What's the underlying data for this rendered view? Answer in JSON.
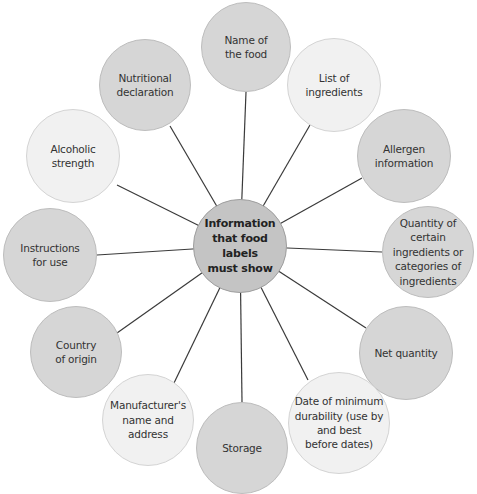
{
  "diagram": {
    "type": "radial-spider-diagram",
    "center": {
      "label": "Information\nthat food labels\nmust show"
    },
    "nodes": [
      {
        "label": "Name of\nthe food",
        "shade": "mid"
      },
      {
        "label": "List of\ningredients",
        "shade": "light"
      },
      {
        "label": "Allergen\ninformation",
        "shade": "mid"
      },
      {
        "label": "Quantity of\ncertain\ningredients or\ncategories of\ningredients",
        "shade": "mid"
      },
      {
        "label": "Net quantity",
        "shade": "mid"
      },
      {
        "label": "Date of minimum\ndurability (use by\nand best\nbefore dates)",
        "shade": "light"
      },
      {
        "label": "Storage",
        "shade": "mid"
      },
      {
        "label": "Manufacturer's\nname and\naddress",
        "shade": "light"
      },
      {
        "label": "Country\nof origin",
        "shade": "mid"
      },
      {
        "label": "Instructions\nfor use",
        "shade": "mid"
      },
      {
        "label": "Alcoholic strength",
        "shade": "light"
      },
      {
        "label": "Nutritional\ndeclaration",
        "shade": "mid"
      }
    ],
    "colors": {
      "hub": "#c4c4c4",
      "mid": "#d6d6d6",
      "light": "#f1f1f1",
      "connector": "#333333"
    }
  }
}
